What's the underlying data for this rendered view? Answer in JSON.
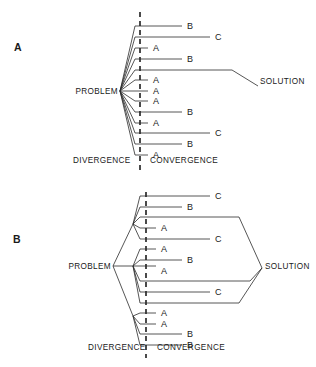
{
  "figure": {
    "background_color": "#ffffff",
    "line_color": "#2b2b2b",
    "panels": [
      {
        "id": "panel-a",
        "label": "A",
        "label_x": 14,
        "label_y": 51,
        "problem_label": "PROBLEM",
        "problem_label_x": 64,
        "problem_label_y": 94,
        "solution_label": "SOLUTION",
        "solution_label_x": 260,
        "solution_label_y": 84,
        "divergence_label": "DIVERGENCE",
        "divergence_label_x": 73,
        "divergence_label_y": 163,
        "convergence_label": "CONVERGENCE",
        "convergence_label_x": 150,
        "convergence_label_y": 163,
        "hub_x": 120,
        "hub_y": 91,
        "bend_x": 135,
        "divider_x": 140,
        "divider_y1": 12,
        "divider_y2": 174,
        "branches": [
          {
            "y": 26,
            "label": "B",
            "end_x": 182,
            "label_x": 187
          },
          {
            "y": 37,
            "label": "C",
            "end_x": 210,
            "label_x": 215
          },
          {
            "y": 48,
            "label": "A",
            "end_x": 148,
            "label_x": 153
          },
          {
            "y": 59,
            "label": "B",
            "end_x": 182,
            "label_x": 187
          },
          {
            "y": 70,
            "label": "",
            "end_x": 232,
            "label_x": 0
          },
          {
            "y": 80,
            "label": "A",
            "end_x": 148,
            "label_x": 153
          },
          {
            "y": 91,
            "label": "A",
            "end_x": 148,
            "label_x": 153
          },
          {
            "y": 101,
            "label": "A",
            "end_x": 148,
            "label_x": 153
          },
          {
            "y": 112,
            "label": "B",
            "end_x": 182,
            "label_x": 187
          },
          {
            "y": 123,
            "label": "A",
            "end_x": 148,
            "label_x": 153
          },
          {
            "y": 133,
            "label": "C",
            "end_x": 210,
            "label_x": 215
          },
          {
            "y": 144,
            "label": "B",
            "end_x": 182,
            "label_x": 187
          },
          {
            "y": 155,
            "label": "A",
            "end_x": 148,
            "label_x": 153
          }
        ],
        "solution_path": "M232,70 L258,86"
      },
      {
        "id": "panel-b",
        "label": "B",
        "label_x": 13,
        "label_y": 243,
        "problem_label": "PROBLEM",
        "problem_label_x": 64,
        "problem_label_y": 269,
        "solution_label": "SOLUTION",
        "solution_label_x": 265,
        "solution_label_y": 269,
        "divergence_label": "DIVERGENCE",
        "divergence_label_x": 88,
        "divergence_label_y": 350,
        "convergence_label": "CONVERGENCE",
        "convergence_label_x": 157,
        "convergence_label_y": 350,
        "hub_x": 113,
        "hub_y": 266,
        "divider_x": 146,
        "divider_y1": 192,
        "divider_y2": 358,
        "subhubs": [
          {
            "x": 133,
            "y": 224
          },
          {
            "x": 133,
            "y": 266
          },
          {
            "x": 133,
            "y": 316
          }
        ],
        "bend_x": 140,
        "converge_x": 262,
        "converge_y": 268,
        "branches": [
          {
            "y": 196,
            "label": "C",
            "end_x": 210,
            "label_x": 215,
            "hub": 0
          },
          {
            "y": 207,
            "label": "B",
            "end_x": 182,
            "label_x": 187,
            "hub": 0
          },
          {
            "y": 217,
            "label": "",
            "end_x": 239,
            "label_x": 0,
            "hub": 0
          },
          {
            "y": 228,
            "label": "A",
            "end_x": 156,
            "label_x": 161,
            "hub": 0
          },
          {
            "y": 239,
            "label": "C",
            "end_x": 210,
            "label_x": 215,
            "hub": 0
          },
          {
            "y": 249,
            "label": "A",
            "end_x": 156,
            "label_x": 161,
            "hub": 1
          },
          {
            "y": 260,
            "label": "B",
            "end_x": 182,
            "label_x": 187,
            "hub": 1
          },
          {
            "y": 271,
            "label": "A",
            "end_x": 156,
            "label_x": 161,
            "hub": 1
          },
          {
            "y": 281,
            "label": "",
            "end_x": 250,
            "label_x": 0,
            "hub": 1
          },
          {
            "y": 292,
            "label": "C",
            "end_x": 210,
            "label_x": 215,
            "hub": 1
          },
          {
            "y": 303,
            "label": "",
            "end_x": 239,
            "label_x": 0,
            "hub": 1
          },
          {
            "y": 313,
            "label": "A",
            "end_x": 156,
            "label_x": 161,
            "hub": 2
          },
          {
            "y": 324,
            "label": "A",
            "end_x": 156,
            "label_x": 161,
            "hub": 2
          },
          {
            "y": 334,
            "label": "B",
            "end_x": 182,
            "label_x": 187,
            "hub": 2
          },
          {
            "y": 345,
            "label": "B",
            "end_x": 182,
            "label_x": 187,
            "hub": 2
          }
        ],
        "converge_paths": [
          "M239,217 L262,268",
          "M250,281 L262,268",
          "M239,303 L262,268"
        ]
      }
    ]
  }
}
